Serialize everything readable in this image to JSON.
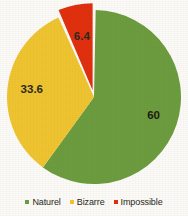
{
  "background_color": "#fbfaf7",
  "chart_data": {
    "type": "pie",
    "title": "",
    "subtitle": "",
    "xlabel": "",
    "ylabel": "",
    "legend_position": "bottom",
    "grid": false,
    "exploded_slices": [
      "Impossible"
    ],
    "start_angle_deg": 0,
    "direction": "clockwise",
    "categories": [
      "Naturel",
      "Bizarre",
      "Impossible"
    ],
    "values": [
      60,
      33.6,
      6.4
    ],
    "labels": [
      "60",
      "33.6",
      "6.4"
    ],
    "colors": [
      "#6d9c3e",
      "#efc431",
      "#e0300f"
    ],
    "slices": [
      {
        "name": "Naturel",
        "value": 60,
        "label": "60",
        "color": "#6d9c3e",
        "label_color": "#1d1b15"
      },
      {
        "name": "Bizarre",
        "value": 33.6,
        "label": "33.6",
        "color": "#efc431",
        "label_color": "#2c2a22"
      },
      {
        "name": "Impossible",
        "value": 6.4,
        "label": "6.4",
        "color": "#e0300f",
        "label_color": "#2c2a22"
      }
    ]
  },
  "legend": {
    "items": [
      {
        "label": "Naturel",
        "color": "#6d9c3e"
      },
      {
        "label": "Bizarre",
        "color": "#efc431"
      },
      {
        "label": "Impossible",
        "color": "#e0300f"
      }
    ]
  }
}
